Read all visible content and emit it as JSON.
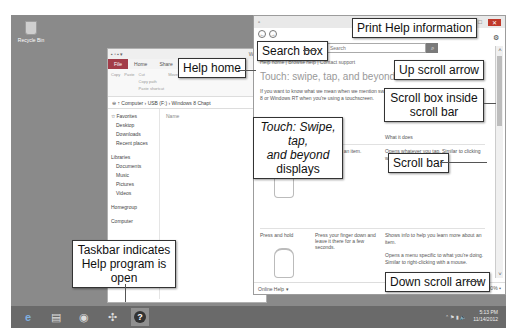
{
  "desktop": {
    "icons": [
      {
        "label": "Recycle Bin",
        "icon": "recycle-bin-icon"
      }
    ]
  },
  "explorer": {
    "title": "Windo",
    "tabs": [
      "File",
      "Home",
      "Share"
    ],
    "ribbon": {
      "clipboard": [
        "Copy",
        "Paste",
        "Cut",
        "Copy path",
        "Paste shortcut"
      ],
      "clipboard_label": "Clipboard",
      "organize": [
        "Move to",
        "Copy to",
        "Delete",
        "Rename"
      ],
      "organize_label": "Organize"
    },
    "address": "Computer › USB (F:) › Windows 8 Chapt",
    "nav": {
      "favorites": "Favorites",
      "favorites_items": [
        "Desktop",
        "Downloads",
        "Recent places"
      ],
      "libraries": "Libraries",
      "libraries_items": [
        "Documents",
        "Music",
        "Pictures",
        "Videos"
      ],
      "homegroup": "Homegroup",
      "computer": "Computer"
    },
    "column_header": "Name"
  },
  "help": {
    "title": "Wi",
    "back_icon": "back-arrow-icon",
    "forward_icon": "forward-arrow-icon",
    "search_placeholder": "Search",
    "links": "Help home | Browse help | Contact support",
    "heading": "Touch: swipe, tap, and beyond",
    "intro": "If you want to know what we mean when we mention swiping, Windows 8 or Windows RT when you're using a touchscreen.",
    "table_header": "What it does",
    "rows": [
      {
        "gesture": "",
        "action": "Tap once on an item.",
        "result": "Opens whatever you tap. Similar to clicking with a mouse."
      },
      {
        "gesture": "Press and hold",
        "action": "Press your finger down and leave it there for a few seconds.",
        "result": "Shows info to help you learn more about an item."
      },
      {
        "gesture": "",
        "action": "",
        "result": "Opens a menu specific to what you're doing. Similar to right-clicking with a mouse."
      }
    ],
    "status_left": "Online Help ▾",
    "zoom": "100% ▾"
  },
  "taskbar": {
    "items": [
      {
        "name": "internet-explorer",
        "glyph": "e"
      },
      {
        "name": "file-explorer",
        "glyph": "▤"
      },
      {
        "name": "store",
        "glyph": "◉"
      },
      {
        "name": "app",
        "glyph": "✣"
      },
      {
        "name": "help",
        "glyph": "?"
      }
    ],
    "time": "5:13 PM",
    "date": "11/14/2012"
  },
  "callouts": {
    "search_box": "Search box",
    "help_home": "Help home",
    "print_help": "Print Help information",
    "up_scroll": "Up scroll arrow",
    "scroll_box": "Scroll box inside scroll bar",
    "touch_displays_1": "Touch: Swipe, tap,",
    "touch_displays_2a": "and beyond",
    "touch_displays_2b": " displays",
    "scroll_bar": "Scroll bar",
    "down_scroll": "Down scroll arrow",
    "taskbar": "Taskbar indicates Help program is open"
  }
}
